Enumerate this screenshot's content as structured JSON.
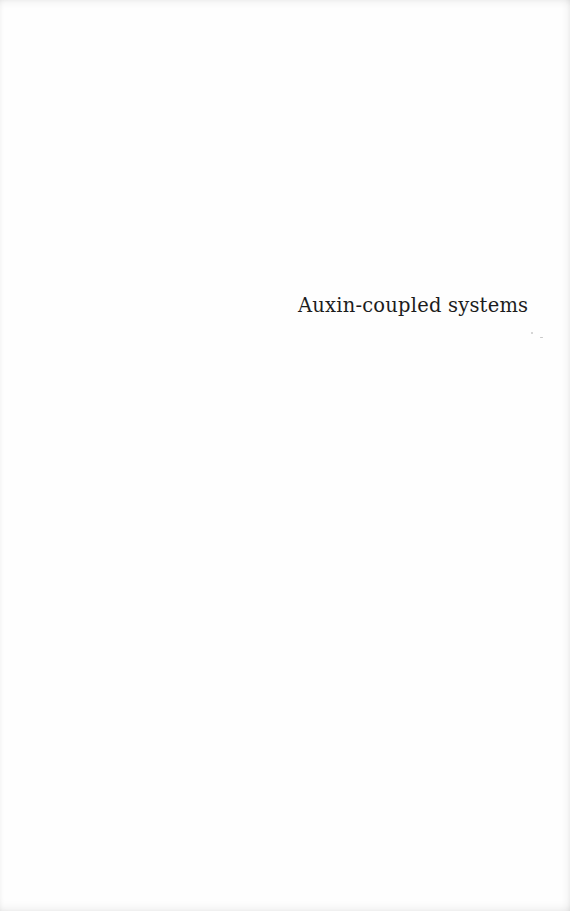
{
  "page": {
    "title": "Auxin-coupled systems",
    "background_color": "#fefefe",
    "text_color": "#1c1c1c"
  }
}
